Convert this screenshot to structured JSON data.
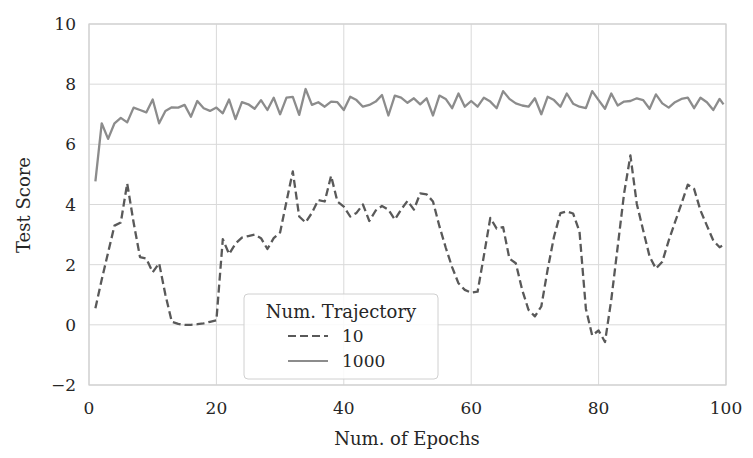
{
  "chart_data": {
    "type": "line",
    "title": "",
    "xlabel": "Num. of Epochs",
    "ylabel": "Test Score",
    "xlim": [
      0,
      100
    ],
    "ylim": [
      -2,
      10
    ],
    "xticks": [
      0,
      20,
      40,
      60,
      80,
      100
    ],
    "yticks": [
      -2,
      0,
      2,
      4,
      6,
      8,
      10
    ],
    "xtick_labels": [
      "0",
      "20",
      "40",
      "60",
      "80",
      "100"
    ],
    "ytick_labels": [
      "−2",
      "0",
      "2",
      "4",
      "6",
      "8",
      "10"
    ],
    "grid": true,
    "legend": {
      "title": "Num. Trajectory",
      "position": "lower center-left",
      "entries": [
        {
          "label": "10",
          "style": "dashed"
        },
        {
          "label": "1000",
          "style": "solid"
        }
      ]
    },
    "series": [
      {
        "name": "10",
        "style": "dashed",
        "color": "#595959",
        "x": [
          1,
          2,
          3,
          4,
          5,
          6,
          7,
          8,
          9,
          10,
          11,
          12,
          13,
          14,
          15,
          16,
          17,
          18,
          19,
          20,
          21,
          22,
          23,
          24,
          25,
          26,
          27,
          28,
          29,
          30,
          31,
          32,
          33,
          34,
          35,
          36,
          37,
          38,
          39,
          40,
          41,
          42,
          43,
          44,
          45,
          46,
          47,
          48,
          49,
          50,
          51,
          52,
          53,
          54,
          55,
          56,
          57,
          58,
          59,
          60,
          61,
          62,
          63,
          64,
          65,
          66,
          67,
          68,
          69,
          70,
          71,
          72,
          73,
          74,
          75,
          76,
          77,
          78,
          79,
          80,
          81,
          82,
          83,
          84,
          85,
          86,
          87,
          88,
          89,
          90,
          91,
          92,
          93,
          94,
          95,
          96,
          97,
          98,
          99,
          99.6
        ],
        "values": [
          0.55,
          1.5,
          2.4,
          3.3,
          3.4,
          4.7,
          3.4,
          2.25,
          2.2,
          1.75,
          2.05,
          1.0,
          0.1,
          0.03,
          0.0,
          0.0,
          0.02,
          0.05,
          0.1,
          0.15,
          2.85,
          2.35,
          2.7,
          2.9,
          2.95,
          3.0,
          2.88,
          2.52,
          2.88,
          3.07,
          4.1,
          5.1,
          3.6,
          3.4,
          3.72,
          4.15,
          4.1,
          4.95,
          4.1,
          3.93,
          3.6,
          3.72,
          4.0,
          3.45,
          3.8,
          3.95,
          3.83,
          3.5,
          3.83,
          4.12,
          3.83,
          4.37,
          4.34,
          4.1,
          3.28,
          2.57,
          1.92,
          1.38,
          1.16,
          1.07,
          1.1,
          2.3,
          3.55,
          3.2,
          3.25,
          2.2,
          2.05,
          1.16,
          0.5,
          0.28,
          0.61,
          1.83,
          2.93,
          3.71,
          3.77,
          3.7,
          3.1,
          0.53,
          -0.35,
          -0.19,
          -0.57,
          0.84,
          2.6,
          4.37,
          5.63,
          4.02,
          3.14,
          2.27,
          1.87,
          2.1,
          2.8,
          3.41,
          4.02,
          4.66,
          4.52,
          3.8,
          3.3,
          2.8,
          2.58,
          2.65
        ]
      },
      {
        "name": "1000",
        "style": "solid",
        "color": "#8c8c8c",
        "x": [
          1,
          2,
          3,
          4,
          5,
          6,
          7,
          8,
          9,
          10,
          11,
          12,
          13,
          14,
          15,
          16,
          17,
          18,
          19,
          20,
          21,
          22,
          23,
          24,
          25,
          26,
          27,
          28,
          29,
          30,
          31,
          32,
          33,
          34,
          35,
          36,
          37,
          38,
          39,
          40,
          41,
          42,
          43,
          44,
          45,
          46,
          47,
          48,
          49,
          50,
          51,
          52,
          53,
          54,
          55,
          56,
          57,
          58,
          59,
          60,
          61,
          62,
          63,
          64,
          65,
          66,
          67,
          68,
          69,
          70,
          71,
          72,
          73,
          74,
          75,
          76,
          77,
          78,
          79,
          80,
          81,
          82,
          83,
          84,
          85,
          86,
          87,
          88,
          89,
          90,
          91,
          92,
          93,
          94,
          95,
          96,
          97,
          98,
          99,
          99.6
        ],
        "values": [
          4.77,
          6.7,
          6.18,
          6.7,
          6.88,
          6.73,
          7.22,
          7.14,
          7.06,
          7.49,
          6.7,
          7.11,
          7.23,
          7.22,
          7.31,
          6.92,
          7.44,
          7.2,
          7.11,
          7.22,
          7.03,
          7.49,
          6.84,
          7.4,
          7.33,
          7.18,
          7.47,
          7.14,
          7.55,
          7.0,
          7.55,
          7.58,
          6.98,
          7.84,
          7.31,
          7.4,
          7.25,
          7.42,
          7.4,
          7.14,
          7.58,
          7.47,
          7.25,
          7.31,
          7.42,
          7.64,
          6.96,
          7.62,
          7.55,
          7.38,
          7.53,
          7.33,
          7.53,
          6.96,
          7.62,
          7.51,
          7.2,
          7.69,
          7.25,
          7.44,
          7.25,
          7.55,
          7.42,
          7.2,
          7.77,
          7.51,
          7.36,
          7.29,
          7.25,
          7.53,
          7.0,
          7.58,
          7.47,
          7.25,
          7.69,
          7.35,
          7.25,
          7.2,
          7.77,
          7.47,
          7.18,
          7.69,
          7.29,
          7.42,
          7.44,
          7.53,
          7.47,
          7.18,
          7.66,
          7.36,
          7.22,
          7.4,
          7.51,
          7.55,
          7.2,
          7.55,
          7.4,
          7.14,
          7.51,
          7.33
        ]
      }
    ]
  },
  "colors": {
    "background": "#ffffff",
    "grid": "#d9d9d9",
    "spine": "#d0d0d0",
    "text": "#262626"
  }
}
